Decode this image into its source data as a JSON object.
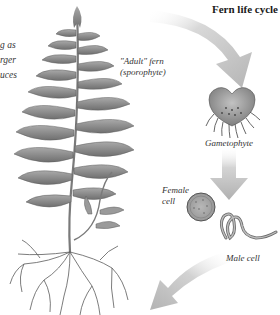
{
  "diagram": {
    "title": "Fern life cycle",
    "side_text_lines": [
      "g as",
      "rger",
      "uces"
    ],
    "stages": [
      {
        "id": "sporophyte",
        "label_line1": "\"Adult\" fern",
        "label_line2": "(sporophyte)"
      },
      {
        "id": "gametophyte",
        "label": "Gametophyte"
      },
      {
        "id": "female-cell",
        "label_line1": "Female",
        "label_line2": "cell"
      },
      {
        "id": "male-cell",
        "label": "Male cell"
      }
    ],
    "arrows": [
      {
        "from": "sporophyte",
        "to": "gametophyte"
      },
      {
        "from": "gametophyte",
        "to": "cells"
      },
      {
        "from": "cells",
        "to": "sporophyte"
      }
    ],
    "colors": {
      "background": "#ffffff",
      "arrow": "#bdbdbd",
      "frond": "#8a8a8a",
      "frond_dark": "#5e5e5e",
      "text": "#333333",
      "gametophyte": "#a3a3a3"
    }
  }
}
